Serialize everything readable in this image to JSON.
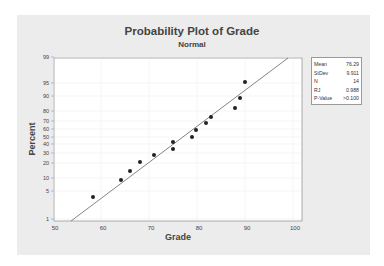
{
  "chart_data": {
    "type": "scatter",
    "title": "Probability Plot of Grade",
    "subtitle": "Normal",
    "xlabel": "Grade",
    "ylabel": "Percent",
    "xlim": [
      50,
      100
    ],
    "x_ticks": [
      50,
      60,
      70,
      80,
      90,
      100
    ],
    "y_scale": "normal-probability",
    "y_ticks": [
      1,
      5,
      10,
      20,
      30,
      40,
      50,
      60,
      70,
      80,
      90,
      95,
      99
    ],
    "grid": true,
    "series": [
      {
        "name": "Grade",
        "x": [
          58,
          64,
          66,
          68,
          71,
          75,
          75,
          79,
          80,
          82,
          83,
          88,
          89,
          90
        ],
        "y": [
          5,
          12,
          19,
          26,
          33,
          40,
          47,
          54,
          61,
          68,
          74,
          81,
          88,
          95
        ]
      }
    ],
    "fit_line": {
      "type": "normal-fit",
      "mean": 76.29,
      "stdev": 9.911
    },
    "legend": {
      "position": "right",
      "entries": [
        {
          "label": "Mean",
          "value": "76.29"
        },
        {
          "label": "StDev",
          "value": "9.911"
        },
        {
          "label": "N",
          "value": "14"
        },
        {
          "label": "RJ",
          "value": "0.988"
        },
        {
          "label": "P-Value",
          "value": ">0.100"
        }
      ]
    }
  },
  "plot": {
    "point_px": [
      [
        93,
        197
      ],
      [
        121,
        180
      ],
      [
        130,
        171
      ],
      [
        140,
        162
      ],
      [
        154,
        155
      ],
      [
        173,
        149
      ],
      [
        173,
        142
      ],
      [
        192,
        137
      ],
      [
        196,
        130
      ],
      [
        206,
        123
      ],
      [
        211,
        117
      ],
      [
        235,
        108
      ],
      [
        240,
        98
      ],
      [
        245,
        82
      ]
    ],
    "line_px": [
      [
        71,
        221
      ],
      [
        288,
        58
      ]
    ],
    "x_tick_px": [
      53,
      101,
      149,
      197,
      245,
      293
    ],
    "y_tick_px": [
      219,
      191,
      178,
      163,
      153,
      144,
      137,
      129,
      121,
      111,
      96,
      83,
      57
    ],
    "colors": {
      "point": "#222222",
      "line": "#777777",
      "frame": "#999999",
      "grid": "#eeeeee"
    }
  }
}
